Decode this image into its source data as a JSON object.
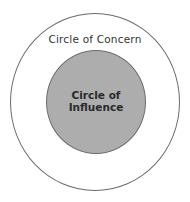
{
  "diagram": {
    "type": "concentric-circles",
    "outer_circle": {
      "label": "Circle of Concern",
      "fill": "#ffffff",
      "stroke": "#6a6a6a"
    },
    "inner_circle": {
      "label_line1": "Circle of",
      "label_line2": "Influence",
      "fill": "#adadad",
      "stroke": "#6e6e6e"
    }
  }
}
